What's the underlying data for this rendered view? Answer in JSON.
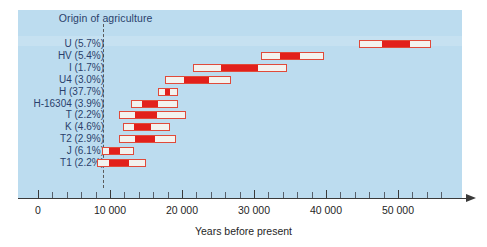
{
  "chart_data": {
    "type": "bar",
    "title": "",
    "xlabel": "Years before present",
    "ylabel": "",
    "xlim": [
      -2000,
      56000
    ],
    "grid": false,
    "legend": "none",
    "orientation": "horizontal",
    "bar_style": "range bars: outer white box = full confidence interval, inner red box = core/most-likely interval",
    "annotations": [
      {
        "label": "Origin of agriculture",
        "x": 9000,
        "style": "dashed vertical line"
      }
    ],
    "axis": {
      "major_ticks": [
        0,
        10000,
        20000,
        30000,
        40000,
        50000
      ],
      "major_tick_labels": [
        "0",
        "10 000",
        "20 000",
        "30 000",
        "40 000",
        "50 000"
      ],
      "minor_tick_interval": 2000,
      "arrow_end": true
    },
    "categories": [
      "U (5.7%)",
      "HV (5.4%)",
      "I (1.7%)",
      "U4 (3.0%)",
      "H (37.7%)",
      "H-16304 (3.9%)",
      "T (2.2%)",
      "K (4.6%)",
      "T2 (2.9%)",
      "J (6.1%)",
      "T1 (2.2%)"
    ],
    "series": [
      {
        "name": "Outer range (full interval)",
        "color": "#f3f2ee",
        "border_color": "#e04a3a",
        "ranges": [
          [
            44600,
            54600
          ],
          [
            31000,
            39700
          ],
          [
            21500,
            34600
          ],
          [
            17600,
            26800
          ],
          [
            16700,
            19500
          ],
          [
            12900,
            19500
          ],
          [
            11200,
            20600
          ],
          [
            11800,
            18300
          ],
          [
            11200,
            19200
          ],
          [
            8900,
            13300
          ],
          [
            8200,
            15000
          ]
        ]
      },
      {
        "name": "Inner core range (most likely)",
        "color": "#e2201b",
        "ranges": [
          [
            47800,
            51600
          ],
          [
            33600,
            36400
          ],
          [
            25400,
            30500
          ],
          [
            20300,
            23800
          ],
          [
            17600,
            18300
          ],
          [
            14400,
            16700
          ],
          [
            13500,
            16600
          ],
          [
            13400,
            15700
          ],
          [
            13500,
            16300
          ],
          [
            9800,
            11400
          ],
          [
            9800,
            12600
          ]
        ]
      }
    ],
    "rows": [
      {
        "haplogroup": "U",
        "frequency_percent": 5.7,
        "label": "U (5.7%)",
        "outer_min": 44600,
        "outer_max": 54600,
        "inner_min": 47800,
        "inner_max": 51600
      },
      {
        "haplogroup": "HV",
        "frequency_percent": 5.4,
        "label": "HV (5.4%)",
        "outer_min": 31000,
        "outer_max": 39700,
        "inner_min": 33600,
        "inner_max": 36400
      },
      {
        "haplogroup": "I",
        "frequency_percent": 1.7,
        "label": "I (1.7%)",
        "outer_min": 21500,
        "outer_max": 34600,
        "inner_min": 25400,
        "inner_max": 30500
      },
      {
        "haplogroup": "U4",
        "frequency_percent": 3.0,
        "label": "U4 (3.0%)",
        "outer_min": 17600,
        "outer_max": 26800,
        "inner_min": 20300,
        "inner_max": 23800
      },
      {
        "haplogroup": "H",
        "frequency_percent": 37.7,
        "label": "H (37.7%)",
        "outer_min": 16700,
        "outer_max": 19500,
        "inner_min": 17600,
        "inner_max": 18300
      },
      {
        "haplogroup": "H-16304",
        "frequency_percent": 3.9,
        "label": "H-16304 (3.9%)",
        "outer_min": 12900,
        "outer_max": 19500,
        "inner_min": 14400,
        "inner_max": 16700
      },
      {
        "haplogroup": "T",
        "frequency_percent": 2.2,
        "label": "T (2.2%)",
        "outer_min": 11200,
        "outer_max": 20600,
        "inner_min": 13500,
        "inner_max": 16600
      },
      {
        "haplogroup": "K",
        "frequency_percent": 4.6,
        "label": "K (4.6%)",
        "outer_min": 11800,
        "outer_max": 18300,
        "inner_min": 13400,
        "inner_max": 15700
      },
      {
        "haplogroup": "T2",
        "frequency_percent": 2.9,
        "label": "T2 (2.9%)",
        "outer_min": 11200,
        "outer_max": 19200,
        "inner_min": 13500,
        "inner_max": 16300
      },
      {
        "haplogroup": "J",
        "frequency_percent": 6.1,
        "label": "J (6.1%)",
        "outer_min": 8900,
        "outer_max": 13300,
        "inner_min": 9800,
        "inner_max": 11400
      },
      {
        "haplogroup": "T1",
        "frequency_percent": 2.2,
        "label": "T1 (2.2%)",
        "outer_min": 8200,
        "outer_max": 15000,
        "inner_min": 9800,
        "inner_max": 12600
      }
    ],
    "colors": {
      "panel_background": "#bcdcef",
      "bar_fill": "#f3f2ee",
      "bar_border": "#e04a3a",
      "bar_core": "#e2201b",
      "label_text": "#2a3f6b",
      "axis": "#3a3a3a",
      "annotation_line": "#5a5a5a"
    }
  }
}
